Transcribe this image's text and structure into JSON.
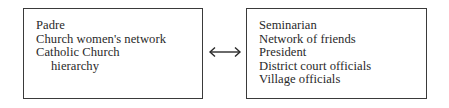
{
  "diagram": {
    "left_box": {
      "items": [
        {
          "text": "Padre",
          "indent": false
        },
        {
          "text": "Church women's network",
          "indent": false
        },
        {
          "text": "Catholic Church",
          "indent": false
        },
        {
          "text": "hierarchy",
          "indent": true
        }
      ]
    },
    "connector": {
      "icon": "double-arrow-icon",
      "direction": "bidirectional",
      "glyph": "↔"
    },
    "right_box": {
      "items": [
        {
          "text": "Seminarian",
          "indent": false
        },
        {
          "text": "Network of friends",
          "indent": false
        },
        {
          "text": "President",
          "indent": false
        },
        {
          "text": "District court officials",
          "indent": false
        },
        {
          "text": "Village officials",
          "indent": false
        }
      ]
    }
  }
}
